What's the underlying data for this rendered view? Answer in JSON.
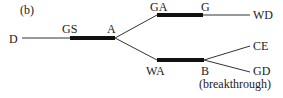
{
  "panel_label": "(b)",
  "nodes": {
    "D": "D",
    "GS": "GS",
    "A": "A",
    "GA": "GA",
    "G": "G",
    "WD": "WD",
    "WA": "WA",
    "B": "B",
    "CE": "CE",
    "GD": "GD"
  },
  "annotation": "(breakthrough)"
}
